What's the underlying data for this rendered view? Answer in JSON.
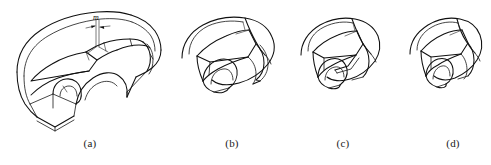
{
  "figure": {
    "type": "line-drawing",
    "background_color": "#ffffff",
    "line_color": "#101010",
    "width": 491,
    "height": 165,
    "panels": [
      {
        "id": "a",
        "caption": "(a)",
        "caption_x": 90,
        "caption_y": 138,
        "annotation": {
          "label": "m",
          "label_x": 96,
          "label_y": 14,
          "kind": "dimension-marker-with-arrows"
        }
      },
      {
        "id": "b",
        "caption": "(b)",
        "caption_x": 232,
        "caption_y": 138
      },
      {
        "id": "c",
        "caption": "(c)",
        "caption_x": 343,
        "caption_y": 138
      },
      {
        "id": "d",
        "caption": "(d)",
        "caption_x": 453,
        "caption_y": 138
      }
    ]
  }
}
